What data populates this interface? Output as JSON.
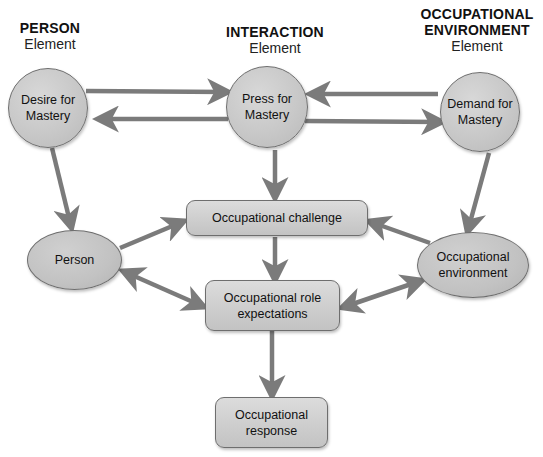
{
  "headers": {
    "person": {
      "title": "PERSON",
      "subtitle": "Element"
    },
    "interaction": {
      "title": "INTERACTION",
      "subtitle": "Element"
    },
    "environment": {
      "title_line1": "OCCUPATIONAL",
      "title_line2": "ENVIRONMENT",
      "subtitle": "Element"
    }
  },
  "nodes": {
    "desire": {
      "line1": "Desire for",
      "line2": "Mastery",
      "shape": "circle"
    },
    "press": {
      "line1": "Press for",
      "line2": "Mastery",
      "shape": "circle"
    },
    "demand": {
      "line1": "Demand for",
      "line2": "Mastery",
      "shape": "circle"
    },
    "person": {
      "label": "Person",
      "shape": "ellipse"
    },
    "environment": {
      "line1": "Occupational",
      "line2": "environment",
      "shape": "ellipse"
    },
    "challenge": {
      "label": "Occupational challenge",
      "shape": "rounded-rect"
    },
    "role": {
      "line1": "Occupational role",
      "line2": "expectations",
      "shape": "rounded-rect"
    },
    "response": {
      "line1": "Occupational",
      "line2": "response",
      "shape": "rounded-rect"
    }
  },
  "edges": [
    {
      "from": "desire",
      "to": "press",
      "type": "single"
    },
    {
      "from": "press",
      "to": "desire",
      "type": "single"
    },
    {
      "from": "demand",
      "to": "press",
      "type": "single"
    },
    {
      "from": "press",
      "to": "demand",
      "type": "single"
    },
    {
      "from": "desire",
      "to": "person",
      "type": "single"
    },
    {
      "from": "press",
      "to": "challenge",
      "type": "single"
    },
    {
      "from": "demand",
      "to": "environment",
      "type": "single"
    },
    {
      "from": "person",
      "to": "challenge",
      "type": "single"
    },
    {
      "from": "environment",
      "to": "challenge",
      "type": "single"
    },
    {
      "from": "challenge",
      "to": "role",
      "type": "single"
    },
    {
      "from": "person",
      "to": "role",
      "type": "bidirectional"
    },
    {
      "from": "environment",
      "to": "role",
      "type": "bidirectional"
    },
    {
      "from": "role",
      "to": "response",
      "type": "single"
    }
  ],
  "colors": {
    "arrow": "#7b7b7b",
    "node_fill": "#c8c8c8",
    "node_border": "#6e6e6e",
    "text": "#111111"
  }
}
